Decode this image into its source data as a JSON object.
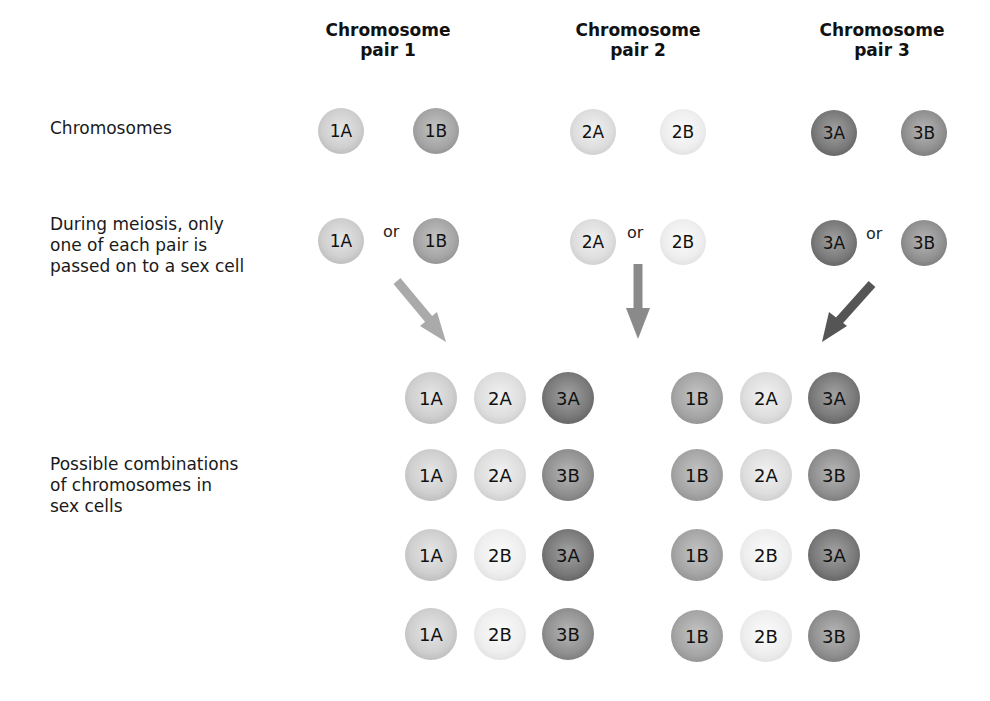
{
  "headers": [
    {
      "line1": "Chromosome",
      "line2": "pair 1"
    },
    {
      "line1": "Chromosome",
      "line2": "pair 2"
    },
    {
      "line1": "Chromosome",
      "line2": "pair 3"
    }
  ],
  "row_labels": {
    "chromosomes": "Chromosomes",
    "meiosis": "During meiosis, only\none of each pair is\npassed on to a sex cell",
    "combinations": "Possible combinations\nof chromosomes in\nsex cells"
  },
  "chromosomes": [
    "1A",
    "1B",
    "2A",
    "2B",
    "3A",
    "3B"
  ],
  "or_label": "or",
  "combinations": [
    [
      "1A",
      "2A",
      "3A"
    ],
    [
      "1A",
      "2A",
      "3B"
    ],
    [
      "1A",
      "2B",
      "3A"
    ],
    [
      "1A",
      "2B",
      "3B"
    ],
    [
      "1B",
      "2A",
      "3A"
    ],
    [
      "1B",
      "2A",
      "3B"
    ],
    [
      "1B",
      "2B",
      "3A"
    ],
    [
      "1B",
      "2B",
      "3B"
    ]
  ],
  "colors": {
    "arrow_pair1": "#aaaaaa",
    "arrow_pair2": "#8a8a8a",
    "arrow_pair3": "#555555"
  }
}
